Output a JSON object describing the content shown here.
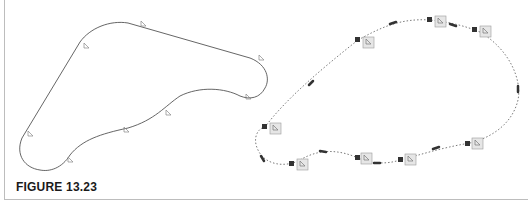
{
  "caption": "FIGURE 13.23",
  "colors": {
    "curve": "#555555",
    "dotted_path": "#6a6a6a",
    "node_fill": "#333333",
    "marker_box_fill": "#e6e6e6",
    "marker_box_stroke": "#9a9a9a",
    "frame": "#bdbdbd",
    "caption": "#1a1a1a"
  },
  "left_shape": {
    "description": "smooth closed curve with cursor markers",
    "markers": [
      {
        "x": 143,
        "y": 24
      },
      {
        "x": 86,
        "y": 46
      },
      {
        "x": 261,
        "y": 58
      },
      {
        "x": 30,
        "y": 134
      },
      {
        "x": 248,
        "y": 97
      },
      {
        "x": 168,
        "y": 113
      },
      {
        "x": 126,
        "y": 130
      },
      {
        "x": 70,
        "y": 160
      }
    ]
  },
  "right_shape": {
    "description": "dotted closed path with square nodes, dashed segments and boxed cursor markers",
    "nodes": [
      {
        "x": 358,
        "y": 40
      },
      {
        "x": 430,
        "y": 20
      },
      {
        "x": 475,
        "y": 30
      },
      {
        "x": 265,
        "y": 127
      },
      {
        "x": 292,
        "y": 163
      },
      {
        "x": 357,
        "y": 157
      },
      {
        "x": 400,
        "y": 159
      },
      {
        "x": 467,
        "y": 143
      }
    ]
  }
}
